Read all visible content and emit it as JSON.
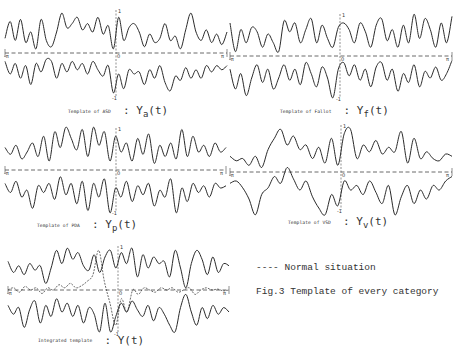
{
  "figure": {
    "title": "Fig.3  Template of every category",
    "legend": "---- Normal situation",
    "axis_labels": {
      "x_left": "-π",
      "x_right": "π",
      "origin": "0",
      "y_top": "1",
      "y_bottom": "-1"
    }
  },
  "panels": [
    {
      "id": "asd",
      "caption_prefix": "Template of ASD",
      "symbol": "Y",
      "sub": "a",
      "arg": "(t)"
    },
    {
      "id": "fallot",
      "caption_prefix": "Template of Fallot",
      "symbol": "Y",
      "sub": "f",
      "arg": "(t)"
    },
    {
      "id": "pda",
      "caption_prefix": "Template of PDA",
      "symbol": "Y",
      "sub": "p",
      "arg": "(t)"
    },
    {
      "id": "vsd",
      "caption_prefix": "Template of VSD",
      "symbol": "Y",
      "sub": "v",
      "arg": "(t)"
    },
    {
      "id": "integrated",
      "caption_prefix": "Integrated template",
      "symbol": "Y",
      "sub": "",
      "arg": "(t)"
    }
  ],
  "chart_data": [
    {
      "type": "line",
      "title": "Template of ASD : Ya(t)",
      "xlabel": "t",
      "ylabel": "Ya(t)",
      "xlim": [
        "-π",
        "π"
      ],
      "ylim": [
        -1,
        1
      ],
      "grid": false,
      "series": [
        {
          "name": "upper envelope",
          "values": [
            0.35,
            0.75,
            0.3,
            0.8,
            0.25,
            0.5,
            0.1,
            0.8,
            0.3,
            0.15,
            0.5,
            0.95,
            0.6,
            0.7,
            0.85,
            0.55,
            0.7,
            0.5,
            0.85,
            0.45,
            0.65,
            0.1,
            0.85,
            0.3,
            0.6,
            0.7,
            0.5,
            0.15,
            0.45,
            0.25,
            0.35,
            0.7,
            0.3,
            0.4,
            0.1,
            0.55,
            0.95,
            0.5,
            0.3,
            0.55,
            0.25,
            0.45,
            0.2,
            0.5
          ]
        },
        {
          "name": "lower envelope",
          "values": [
            -0.2,
            -0.5,
            -0.25,
            -0.6,
            -0.3,
            -0.75,
            -0.25,
            -0.45,
            -0.15,
            -0.2,
            -0.6,
            -0.25,
            -0.45,
            -0.2,
            -0.4,
            -0.25,
            -0.5,
            -0.2,
            -0.4,
            -0.55,
            -0.3,
            -0.95,
            -0.5,
            -0.85,
            -0.4,
            -0.5,
            -0.45,
            -0.75,
            -0.4,
            -0.6,
            -0.3,
            -0.7,
            -0.9,
            -0.55,
            -0.65,
            -0.35,
            -0.6,
            -0.4,
            -0.6,
            -0.3,
            -0.45,
            -0.3,
            -0.4,
            -0.3
          ]
        },
        {
          "name": "Normal situation",
          "values": [
            0
          ]
        }
      ]
    },
    {
      "type": "line",
      "title": "Template of Fallot : Yf(t)",
      "xlabel": "t",
      "ylabel": "Yf(t)",
      "xlim": [
        "-π",
        "π"
      ],
      "ylim": [
        -1,
        1
      ],
      "grid": false,
      "series": [
        {
          "name": "upper envelope",
          "values": [
            0.75,
            0.1,
            0.6,
            0.3,
            0.65,
            0.55,
            0.2,
            0.5,
            0.3,
            0.1,
            0.8,
            0.55,
            0.75,
            0.3,
            0.6,
            0.85,
            0.3,
            0.7,
            0.4,
            0.2,
            0.65,
            0.75,
            0.6,
            0.3,
            0.75,
            0.55,
            0.2,
            0.7,
            0.85,
            0.35,
            0.6,
            0.2,
            0.7,
            0.3,
            0.95,
            0.4,
            0.85,
            0.6,
            0.2,
            0.75,
            0.3,
            0.9
          ]
        },
        {
          "name": "lower envelope",
          "values": [
            -0.3,
            -0.75,
            -0.4,
            -0.9,
            -0.5,
            -0.2,
            -0.6,
            -0.3,
            -0.75,
            -0.5,
            -0.2,
            -0.55,
            -0.3,
            -0.65,
            -0.15,
            -0.4,
            -0.7,
            -0.25,
            -0.5,
            -0.95,
            -0.3,
            -0.15,
            -0.45,
            -0.2,
            -0.55,
            -0.3,
            -0.7,
            -0.25,
            -0.15,
            -0.55,
            -0.3,
            -0.8,
            -0.4,
            -0.6,
            -0.2,
            -0.7,
            -0.35,
            -0.5,
            -0.25,
            -0.55,
            -0.4,
            -0.1
          ]
        },
        {
          "name": "Normal situation",
          "values": [
            0
          ]
        }
      ]
    },
    {
      "type": "line",
      "title": "Template of PDA : Yp(t)",
      "xlabel": "t",
      "ylabel": "Yp(t)",
      "xlim": [
        "-π",
        "π"
      ],
      "ylim": [
        -1,
        1
      ],
      "grid": false,
      "series": [
        {
          "name": "upper envelope",
          "values": [
            0.5,
            0.35,
            0.55,
            0.25,
            0.4,
            0.6,
            0.3,
            0.75,
            0.2,
            0.85,
            0.5,
            0.95,
            0.7,
            0.45,
            0.9,
            0.3,
            0.95,
            0.55,
            0.85,
            0.2,
            0.75,
            0.4,
            0.6,
            0.2,
            0.7,
            0.35,
            0.8,
            0.15,
            0.55,
            0.3,
            0.6,
            0.25,
            0.9,
            0.3,
            0.75,
            0.4,
            0.55,
            0.3,
            0.6,
            0.4,
            0.5
          ]
        },
        {
          "name": "lower envelope",
          "values": [
            -0.3,
            -0.5,
            -0.25,
            -0.6,
            -0.45,
            -0.85,
            -0.35,
            -0.5,
            -0.3,
            -0.65,
            -0.15,
            -0.55,
            -0.3,
            -0.75,
            -0.25,
            -0.9,
            -0.3,
            -0.6,
            -0.2,
            -0.95,
            -0.4,
            -0.6,
            -0.25,
            -0.7,
            -0.35,
            -0.55,
            -0.3,
            -0.8,
            -0.45,
            -0.6,
            -0.2,
            -0.95,
            -0.4,
            -0.7,
            -0.3,
            -0.5,
            -0.35,
            -0.6,
            -0.3,
            -0.4,
            -0.35
          ]
        },
        {
          "name": "Normal situation",
          "values": [
            0
          ]
        }
      ]
    },
    {
      "type": "line",
      "title": "Template of VSD : Yv(t)",
      "xlabel": "t",
      "ylabel": "Yv(t)",
      "xlim": [
        "-π",
        "π"
      ],
      "ylim": [
        -1,
        1
      ],
      "grid": false,
      "series": [
        {
          "name": "upper envelope",
          "values": [
            0.35,
            0.25,
            0.3,
            0.15,
            0.35,
            0.1,
            0.5,
            0.75,
            0.95,
            0.6,
            0.8,
            0.5,
            0.6,
            0.3,
            0.55,
            0.2,
            0.75,
            0.15,
            0.85,
            0.95,
            0.3,
            0.6,
            0.45,
            0.7,
            0.4,
            0.55,
            0.45,
            0.9,
            0.2,
            0.75,
            0.3,
            0.45,
            0.3,
            0.25,
            0.4,
            0.35
          ]
        },
        {
          "name": "lower envelope",
          "values": [
            -0.25,
            -0.2,
            -0.35,
            -0.6,
            -0.95,
            -0.5,
            -0.35,
            -0.1,
            -0.25,
            0.1,
            -0.15,
            -0.4,
            -0.2,
            -0.55,
            -0.8,
            -0.95,
            -0.5,
            -0.75,
            -0.2,
            -0.4,
            -0.3,
            -0.5,
            -0.2,
            -0.45,
            -0.7,
            -0.3,
            -0.95,
            -0.55,
            -0.3,
            -0.7,
            -0.4,
            -0.6,
            -0.3,
            -0.4,
            -0.2,
            -0.1
          ]
        },
        {
          "name": "Normal situation",
          "values": [
            0
          ]
        }
      ]
    },
    {
      "type": "line",
      "title": "Integrated template : Y(t)",
      "xlabel": "t",
      "ylabel": "Y(t)",
      "xlim": [
        "-π",
        "π"
      ],
      "ylim": [
        -1,
        1
      ],
      "grid": false,
      "series": [
        {
          "name": "upper envelope",
          "values": [
            0.65,
            0.4,
            0.55,
            0.35,
            0.6,
            0.45,
            0.55,
            0.15,
            0.5,
            0.9,
            0.6,
            0.95,
            0.7,
            0.85,
            0.55,
            0.45,
            0.8,
            0.4,
            0.75,
            0.9,
            0.5,
            0.85,
            0.6,
            0.95,
            0.3,
            0.8,
            0.5,
            0.75,
            0.6,
            0.65,
            0.3,
            0.9,
            0.5,
            0.05,
            0.6,
            0.9,
            0.7,
            0.35,
            0.75,
            0.4,
            0.6,
            0.55
          ]
        },
        {
          "name": "lower envelope",
          "values": [
            -0.35,
            -0.55,
            -0.4,
            -0.85,
            -0.45,
            -0.25,
            -0.75,
            -0.35,
            -0.6,
            -0.2,
            -0.5,
            -0.3,
            -0.6,
            -0.35,
            -0.75,
            -0.4,
            -0.55,
            -0.95,
            -0.3,
            -0.95,
            -0.6,
            -0.3,
            -0.5,
            -0.25,
            -0.45,
            -0.6,
            -0.35,
            -0.7,
            -0.4,
            -0.55,
            -0.8,
            -0.95,
            -0.4,
            -0.1,
            -0.5,
            -0.8,
            -0.4,
            -0.65,
            -0.35,
            -0.55,
            -0.4,
            -0.5
          ]
        },
        {
          "name": "Normal situation",
          "values": [
            0,
            0.05,
            -0.05,
            0.08,
            0,
            0.05,
            -0.08,
            0.05,
            0,
            0.12,
            0.05,
            0.15,
            0.05,
            0.1,
            0.2,
            0.35,
            0.9,
            0.2,
            -0.3,
            -0.8,
            -0.2,
            -0.5,
            0,
            -0.1,
            0.05,
            0,
            -0.05,
            0.05,
            0,
            0.05,
            -0.05,
            0,
            0.05,
            -0.1,
            0,
            0.05,
            0,
            0.02,
            -0.02,
            0
          ]
        }
      ]
    }
  ],
  "layout": {
    "panels": [
      {
        "x0": 5,
        "x1": 227,
        "yc": 53,
        "amp": 42,
        "cx": 116,
        "yTop": 10,
        "yBot": 97,
        "cap_x": 68,
        "cap_y": 101
      },
      {
        "x0": 230,
        "x1": 452,
        "yc": 56,
        "amp": 44,
        "cx": 340,
        "yTop": 14,
        "yBot": 98,
        "cap_x": 280,
        "cap_y": 101
      },
      {
        "x0": 5,
        "x1": 226,
        "yc": 170,
        "amp": 45,
        "cx": 116,
        "yTop": 128,
        "yBot": 212,
        "cap_x": 37,
        "cap_y": 215
      },
      {
        "x0": 230,
        "x1": 452,
        "yc": 172,
        "amp": 45,
        "cx": 341,
        "yTop": 125,
        "yBot": 210,
        "cap_x": 288,
        "cap_y": 212
      },
      {
        "x0": 8,
        "x1": 229,
        "yc": 290,
        "amp": 44,
        "cx": 118,
        "yTop": 246,
        "yBot": 333,
        "cap_x": 38,
        "cap_y": 330
      }
    ]
  }
}
